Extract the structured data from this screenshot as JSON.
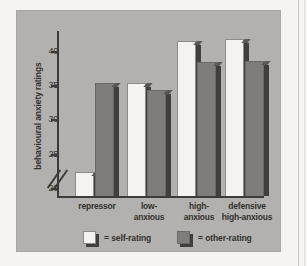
{
  "figure": {
    "panel_bg": "#b2b1af",
    "page_bg": "#f5f4f2"
  },
  "chart_data": {
    "type": "bar",
    "title": "",
    "subtitle": "",
    "xlabel": "",
    "ylabel": "behavioural anxiety ratings",
    "categories": [
      "repressor",
      "low-\nanxious",
      "high-\nanxious",
      "defensive\nhigh-anxious"
    ],
    "category_lines": [
      [
        "repressor"
      ],
      [
        "low-",
        "anxious"
      ],
      [
        "high-",
        "anxious"
      ],
      [
        "defensive",
        "high-anxious"
      ]
    ],
    "series": [
      {
        "name": "self-rating",
        "color": "#f4f3ef",
        "values": [
          22.5,
          35.4,
          41.6,
          41.8
        ]
      },
      {
        "name": "other-rating",
        "color": "#7e7d7a",
        "values": [
          35.5,
          34.4,
          38.5,
          38.7
        ]
      }
    ],
    "yticks": [
      20,
      25,
      30,
      35,
      40
    ],
    "ytick_labels": [
      "20",
      "25",
      "30",
      "35",
      "40"
    ],
    "ylim": [
      19.0,
      43.0
    ],
    "axis_break": true,
    "axis_break_note": "y-axis broken below 20",
    "grid": false,
    "legend_position": "bottom"
  },
  "legend": {
    "items": [
      {
        "swatch": "self",
        "label": "= self-rating"
      },
      {
        "swatch": "other",
        "label": "= other-rating"
      }
    ]
  }
}
